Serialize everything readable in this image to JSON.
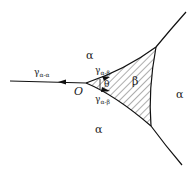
{
  "diagram": {
    "region_labels": {
      "alpha_top": "α",
      "alpha_right": "α",
      "alpha_bottom": "α",
      "beta": "β"
    },
    "point_label": "O",
    "angle_label": "θ",
    "curves": {
      "left": {
        "symbol": "γ",
        "subscript": "α-α"
      },
      "upper": {
        "symbol": "γ",
        "subscript": "α-β"
      },
      "lower": {
        "symbol": "γ",
        "subscript": "α-β"
      }
    }
  }
}
